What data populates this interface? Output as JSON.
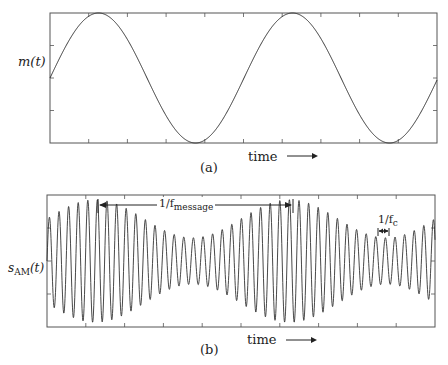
{
  "panel_a": {
    "ylabel": "m(t)",
    "time_label": "time",
    "caption": "(a)",
    "frame": {
      "x0": 50,
      "y0": 13,
      "x1": 437,
      "y1": 143
    },
    "waveform": {
      "type": "sine",
      "period_px": 194,
      "phase_start": "zero-crossing rising",
      "cycles": 2
    }
  },
  "panel_b": {
    "ylabel_main": "s",
    "ylabel_sub": "AM",
    "ylabel_arg": "(t)",
    "time_label": "time",
    "caption": "(b)",
    "frame": {
      "x0": 47,
      "y0": 195,
      "x1": 435,
      "y1": 327
    },
    "annotation_message": {
      "prefix": "1/f",
      "sub": "message"
    },
    "annotation_carrier": {
      "prefix": "1/f",
      "sub": "c"
    },
    "waveform": {
      "type": "AM",
      "carrier_period_px": 9.6,
      "envelope_period_px": 194,
      "modulation_index": 0.45
    }
  },
  "colors": {
    "line": "#333333",
    "frame": "#555555",
    "background": "#ffffff"
  }
}
